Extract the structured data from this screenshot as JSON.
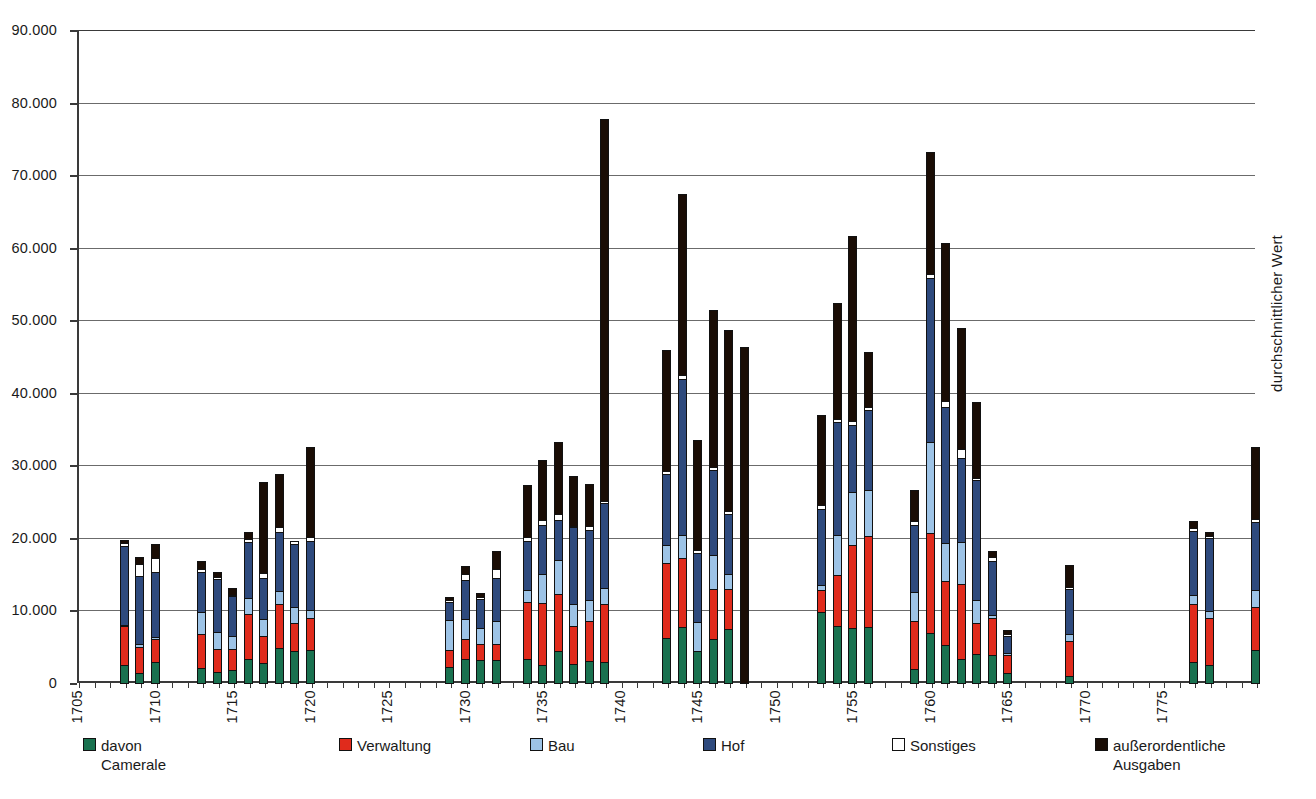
{
  "chart_data": {
    "type": "bar",
    "subtype": "stacked",
    "title": "",
    "xlabel": "",
    "ylabel": "",
    "ylim": [
      0,
      90000
    ],
    "ytick_values": [
      0,
      10000,
      20000,
      30000,
      40000,
      50000,
      60000,
      70000,
      80000,
      90000
    ],
    "ytick_labels": [
      "0",
      "10.000",
      "20.000",
      "30.000",
      "40.000",
      "50.000",
      "60.000",
      "70.000",
      "80.000",
      "90.000"
    ],
    "xlim": [
      1705,
      1781
    ],
    "xtick_labels": [
      "1705",
      "1710",
      "1715",
      "1720",
      "1725",
      "1730",
      "1735",
      "1740",
      "1745",
      "1750",
      "1755",
      "1760",
      "1765",
      "1770",
      "1775"
    ],
    "xtick_values": [
      1705,
      1710,
      1715,
      1720,
      1725,
      1730,
      1735,
      1740,
      1745,
      1750,
      1755,
      1760,
      1765,
      1770,
      1775
    ],
    "grid": true,
    "legend_position": "bottom",
    "right_axis_caption": "durchschnittlicher Wert",
    "series": [
      {
        "name": "davon Camerale",
        "color": "#19714f",
        "key": "camerale"
      },
      {
        "name": "Verwaltung",
        "color": "#e02b1c",
        "key": "verwaltung"
      },
      {
        "name": "Bau",
        "color": "#9dc3e6",
        "key": "bau"
      },
      {
        "name": "Hof",
        "color": "#2e4a7d",
        "key": "hof"
      },
      {
        "name": "Sonstiges",
        "color": "#ffffff",
        "key": "sonstiges"
      },
      {
        "name": "außerordentliche Ausgaben",
        "color": "#1a0d05",
        "key": "ausserordentliche"
      }
    ],
    "points": [
      {
        "x": 1708,
        "camerale": 2600,
        "verwaltung": 5500,
        "bau": 300,
        "hof": 11000,
        "sonstiges": 600,
        "ausserordentliche": 500,
        "total": 20500
      },
      {
        "x": 1709,
        "camerale": 1500,
        "verwaltung": 3800,
        "bau": 500,
        "hof": 9500,
        "sonstiges": 1800,
        "ausserordentliche": 1100,
        "total": 18200
      },
      {
        "x": 1710,
        "camerale": 3100,
        "verwaltung": 3200,
        "bau": 400,
        "hof": 9200,
        "sonstiges": 2000,
        "ausserordentliche": 2100,
        "total": 20000
      },
      {
        "x": 1713,
        "camerale": 2200,
        "verwaltung": 4800,
        "bau": 3200,
        "hof": 5600,
        "sonstiges": 600,
        "ausserordentliche": 1200,
        "total": 17600
      },
      {
        "x": 1714,
        "camerale": 1700,
        "verwaltung": 3200,
        "bau": 2600,
        "hof": 7400,
        "sonstiges": 400,
        "ausserordentliche": 900,
        "total": 16200
      },
      {
        "x": 1715,
        "camerale": 1900,
        "verwaltung": 3100,
        "bau": 1900,
        "hof": 5700,
        "sonstiges": 200,
        "ausserordentliche": 1000,
        "total": 13800
      },
      {
        "x": 1716,
        "camerale": 3500,
        "verwaltung": 6300,
        "bau": 2300,
        "hof": 7900,
        "sonstiges": 500,
        "ausserordentliche": 1200,
        "total": 21700
      },
      {
        "x": 1717,
        "camerale": 2900,
        "verwaltung": 3800,
        "bau": 2500,
        "hof": 5800,
        "sonstiges": 800,
        "ausserordentliche": 12700,
        "total": 28500
      },
      {
        "x": 1718,
        "camerale": 5000,
        "verwaltung": 6200,
        "bau": 1900,
        "hof": 8300,
        "sonstiges": 800,
        "ausserordentliche": 7400,
        "total": 29600
      },
      {
        "x": 1719,
        "camerale": 4600,
        "verwaltung": 4000,
        "bau": 2300,
        "hof": 8800,
        "sonstiges": 600,
        "ausserordentliche": 0,
        "total": 20300
      },
      {
        "x": 1720,
        "camerale": 4700,
        "verwaltung": 4500,
        "bau": 1300,
        "hof": 9600,
        "sonstiges": 700,
        "ausserordentliche": 12500,
        "total": 33300
      },
      {
        "x": 1729,
        "camerale": 2300,
        "verwaltung": 2500,
        "bau": 4300,
        "hof": 2600,
        "sonstiges": 500,
        "ausserordentliche": 500,
        "total": 12700
      },
      {
        "x": 1730,
        "camerale": 3400,
        "verwaltung": 2900,
        "bau": 3000,
        "hof": 5500,
        "sonstiges": 900,
        "ausserordentliche": 1300,
        "total": 17000
      },
      {
        "x": 1731,
        "camerale": 3300,
        "verwaltung": 2300,
        "bau": 2400,
        "hof": 4100,
        "sonstiges": 400,
        "ausserordentliche": 700,
        "total": 13200
      },
      {
        "x": 1732,
        "camerale": 3300,
        "verwaltung": 2300,
        "bau": 3300,
        "hof": 6100,
        "sonstiges": 1400,
        "ausserordentliche": 2600,
        "total": 19000
      },
      {
        "x": 1734,
        "camerale": 3500,
        "verwaltung": 8000,
        "bau": 1800,
        "hof": 6800,
        "sonstiges": 700,
        "ausserordentliche": 7300,
        "total": 28100
      },
      {
        "x": 1735,
        "camerale": 2600,
        "verwaltung": 8700,
        "bau": 4200,
        "hof": 6900,
        "sonstiges": 800,
        "ausserordentliche": 8300,
        "total": 31500
      },
      {
        "x": 1736,
        "camerale": 4600,
        "verwaltung": 7900,
        "bau": 4900,
        "hof": 5600,
        "sonstiges": 1000,
        "ausserordentliche": 10000,
        "total": 34000
      },
      {
        "x": 1737,
        "camerale": 2800,
        "verwaltung": 5400,
        "bau": 3100,
        "hof": 10700,
        "sonstiges": 400,
        "ausserordentliche": 7000,
        "total": 29400
      },
      {
        "x": 1738,
        "camerale": 3200,
        "verwaltung": 5600,
        "bau": 3000,
        "hof": 9900,
        "sonstiges": 600,
        "ausserordentliche": 5900,
        "total": 28200
      },
      {
        "x": 1739,
        "camerale": 3100,
        "verwaltung": 8000,
        "bau": 2400,
        "hof": 11800,
        "sonstiges": 500,
        "ausserordentliche": 52700,
        "total": 78500
      },
      {
        "x": 1743,
        "camerale": 6300,
        "verwaltung": 10500,
        "bau": 2700,
        "hof": 9900,
        "sonstiges": 500,
        "ausserordentliche": 16800,
        "total": 46700
      },
      {
        "x": 1744,
        "camerale": 7800,
        "verwaltung": 9700,
        "bau": 3300,
        "hof": 21600,
        "sonstiges": 700,
        "ausserordentliche": 25100,
        "total": 68200
      },
      {
        "x": 1745,
        "camerale": 4500,
        "verwaltung": 0,
        "bau": 4200,
        "hof": 9700,
        "sonstiges": 500,
        "ausserordentliche": 15300,
        "total": 34200
      },
      {
        "x": 1746,
        "camerale": 6200,
        "verwaltung": 7000,
        "bau": 4800,
        "hof": 11900,
        "sonstiges": 600,
        "ausserordentliche": 21800,
        "total": 52300
      },
      {
        "x": 1747,
        "camerale": 7600,
        "verwaltung": 5700,
        "bau": 2100,
        "hof": 8500,
        "sonstiges": 500,
        "ausserordentliche": 25100,
        "total": 49500
      },
      {
        "x": 1748,
        "camerale": 0,
        "verwaltung": 0,
        "bau": 0,
        "hof": 0,
        "sonstiges": 0,
        "ausserordentliche": 46500,
        "total": 46500
      },
      {
        "x": 1753,
        "camerale": 9900,
        "verwaltung": 3200,
        "bau": 800,
        "hof": 10600,
        "sonstiges": 700,
        "ausserordentliche": 12600,
        "total": 37800
      },
      {
        "x": 1754,
        "camerale": 8000,
        "verwaltung": 7100,
        "bau": 5700,
        "hof": 15800,
        "sonstiges": 500,
        "ausserordentliche": 16100,
        "total": 52800
      },
      {
        "x": 1755,
        "camerale": 7700,
        "verwaltung": 11600,
        "bau": 7500,
        "hof": 9300,
        "sonstiges": 700,
        "ausserordentliche": 25600,
        "total": 62400
      },
      {
        "x": 1756,
        "camerale": 7800,
        "verwaltung": 12700,
        "bau": 6500,
        "hof": 11200,
        "sonstiges": 500,
        "ausserordentliche": 7800,
        "total": 46500
      },
      {
        "x": 1759,
        "camerale": 2100,
        "verwaltung": 6700,
        "bau": 4200,
        "hof": 9400,
        "sonstiges": 600,
        "ausserordentliche": 4500,
        "total": 27500
      },
      {
        "x": 1760,
        "camerale": 7100,
        "verwaltung": 13900,
        "bau": 12600,
        "hof": 22800,
        "sonstiges": 700,
        "ausserordentliche": 16900,
        "total": 74000
      },
      {
        "x": 1761,
        "camerale": 5400,
        "verwaltung": 9000,
        "bau": 5300,
        "hof": 18900,
        "sonstiges": 1000,
        "ausserordentliche": 21900,
        "total": 61500
      },
      {
        "x": 1762,
        "camerale": 3500,
        "verwaltung": 10400,
        "bau": 5900,
        "hof": 11800,
        "sonstiges": 1400,
        "ausserordentliche": 16700,
        "total": 49700
      },
      {
        "x": 1763,
        "camerale": 4100,
        "verwaltung": 4500,
        "bau": 3200,
        "hof": 16800,
        "sonstiges": 300,
        "ausserordentliche": 10700,
        "total": 39600
      },
      {
        "x": 1764,
        "camerale": 4000,
        "verwaltung": 5200,
        "bau": 600,
        "hof": 7600,
        "sonstiges": 700,
        "ausserordentliche": 900,
        "total": 19000
      },
      {
        "x": 1765,
        "camerale": 1500,
        "verwaltung": 2600,
        "bau": 500,
        "hof": 2400,
        "sonstiges": 400,
        "ausserordentliche": 800,
        "total": 8200
      },
      {
        "x": 1769,
        "camerale": 1100,
        "verwaltung": 4900,
        "bau": 1200,
        "hof": 6300,
        "sonstiges": 400,
        "ausserordentliche": 3200,
        "total": 17100
      },
      {
        "x": 1777,
        "camerale": 3100,
        "verwaltung": 8000,
        "bau": 1400,
        "hof": 9000,
        "sonstiges": 500,
        "ausserordentliche": 1100,
        "total": 23100
      },
      {
        "x": 1778,
        "camerale": 2600,
        "verwaltung": 6700,
        "bau": 1100,
        "hof": 10200,
        "sonstiges": 300,
        "ausserordentliche": 700,
        "total": 21600
      },
      {
        "x": 1781,
        "camerale": 4700,
        "verwaltung": 6000,
        "bau": 2600,
        "hof": 9400,
        "sonstiges": 600,
        "ausserordentliche": 10000,
        "total": 33300,
        "is_average": true
      }
    ]
  },
  "legend": {
    "items": [
      {
        "label": "davon\nCamerale",
        "color": "#19714f",
        "left": 6
      },
      {
        "label": "Verwaltung",
        "color": "#e02b1c",
        "left": 262
      },
      {
        "label": "Bau",
        "color": "#9dc3e6",
        "left": 453
      },
      {
        "label": "Hof",
        "color": "#2e4a7d",
        "left": 626
      },
      {
        "label": "Sonstiges",
        "color": "#ffffff",
        "left": 815
      },
      {
        "label": "außerordentliche\nAusgaben",
        "color": "#1a0d05",
        "left": 1018
      }
    ]
  }
}
